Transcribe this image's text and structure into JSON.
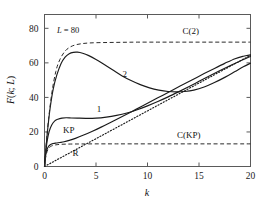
{
  "chart_data": {
    "type": "line",
    "title": "",
    "xlabel": "k",
    "ylabel": "F(k; L)",
    "xlim": [
      0,
      20
    ],
    "ylim": [
      0,
      88
    ],
    "xticks": [
      "0",
      "5",
      "10",
      "15",
      "20"
    ],
    "yticks": [
      "0",
      "20",
      "40",
      "60",
      "80"
    ],
    "xtick_values": [
      0,
      5,
      10,
      15,
      20
    ],
    "ytick_values": [
      0,
      20,
      40,
      60,
      80
    ],
    "grid": false,
    "legend": "inline-labels",
    "annotations": [
      {
        "text": "L = 80",
        "x": 1.6,
        "y": 81,
        "note": "panel parameter"
      }
    ],
    "series": [
      {
        "name": "2",
        "label": "2",
        "style": "solid",
        "label_x": 7.8,
        "label_y": 52,
        "x": [
          0,
          0.12,
          0.3,
          0.55,
          0.85,
          1.2,
          1.6,
          2.0,
          2.4,
          2.8,
          3.2,
          3.7,
          4.3,
          5.0,
          5.8,
          6.6,
          7.5,
          8.4,
          9.3,
          10.2,
          11.1,
          12.0,
          12.8,
          13.6,
          14.5,
          15.5,
          16.5,
          17.5,
          18.5,
          19.3,
          20
        ],
        "y": [
          0,
          9,
          21,
          34,
          45,
          53,
          59.5,
          63.3,
          65.3,
          66.1,
          66.2,
          65.6,
          64.2,
          62.0,
          59.0,
          56.0,
          52.6,
          49.8,
          47.4,
          45.5,
          44.2,
          43.4,
          43.2,
          43.4,
          44.2,
          46.0,
          48.6,
          51.6,
          55.0,
          57.7,
          59.8
        ]
      },
      {
        "name": "1",
        "label": "1",
        "style": "solid",
        "label_x": 5.3,
        "label_y": 31.5,
        "x": [
          0,
          0.1,
          0.25,
          0.45,
          0.7,
          1.0,
          1.3,
          1.7,
          2.1,
          2.6,
          3.2,
          4.0,
          5.0,
          6.0,
          7.0,
          8.0,
          9.0,
          10.0,
          11.0,
          12.0,
          13.0,
          14.0,
          15.0,
          16.0,
          17.0,
          18.0,
          19.0,
          20
        ],
        "y": [
          0,
          7,
          14.5,
          20.2,
          24.0,
          26.4,
          27.4,
          28.0,
          28.2,
          28.1,
          28.0,
          27.9,
          28.0,
          28.6,
          29.6,
          31.0,
          32.9,
          35.1,
          37.6,
          40.3,
          43.2,
          46.2,
          49.3,
          52.4,
          55.4,
          58.3,
          61.1,
          63.7
        ]
      },
      {
        "name": "KP",
        "label": "KP",
        "style": "solid",
        "label_x": 2.35,
        "label_y": 19.5,
        "x": [
          0,
          0.08,
          0.2,
          0.38,
          0.6,
          0.85,
          1.15,
          1.5,
          1.9,
          2.4,
          3.0,
          3.8,
          4.6,
          5.5,
          6.5,
          7.5,
          8.5,
          9.5,
          10.5,
          11.5,
          12.5,
          13.5,
          14.5,
          15.5,
          16.5,
          17.5,
          18.5,
          19.3,
          20
        ],
        "y": [
          0,
          5.0,
          9.0,
          11.6,
          12.8,
          13.3,
          13.6,
          13.9,
          14.3,
          15.1,
          16.3,
          18.2,
          20.3,
          22.8,
          25.8,
          28.8,
          31.9,
          35.0,
          38.2,
          41.3,
          44.5,
          47.6,
          50.7,
          53.8,
          56.8,
          59.7,
          62.4,
          63.8,
          64.6
        ]
      },
      {
        "name": "R",
        "label": "R",
        "style": "dotted",
        "label_x": 3.0,
        "label_y": 6.0,
        "x": [
          0,
          20
        ],
        "y": [
          0,
          64.4
        ]
      },
      {
        "name": "C(2)",
        "label": "C(2)",
        "style": "dashed",
        "label_x": 14.2,
        "label_y": 76.5,
        "x": [
          0,
          0.3,
          0.7,
          1.1,
          1.5,
          2.0,
          2.5,
          3.0,
          3.6,
          4.3,
          5.2,
          6.2,
          7.5,
          9.0,
          11.0,
          13.0,
          15.0,
          17.0,
          20
        ],
        "y": [
          0,
          22,
          42,
          55,
          62,
          66.8,
          69.2,
          70.4,
          71.1,
          71.5,
          71.7,
          71.8,
          71.9,
          72.0,
          72.0,
          72.0,
          72.0,
          72.0,
          72.0
        ]
      },
      {
        "name": "C(KP)",
        "label": "C(KP)",
        "style": "dashed",
        "label_x": 14.0,
        "label_y": 16.5,
        "x": [
          0,
          0.15,
          0.35,
          0.6,
          0.9,
          1.3,
          1.8,
          2.5,
          3.5,
          5.0,
          7.0,
          10.0,
          14.0,
          17.0,
          20
        ],
        "y": [
          0,
          6.5,
          10.0,
          11.6,
          12.3,
          12.7,
          12.9,
          13.0,
          13.05,
          13.1,
          13.1,
          13.1,
          13.1,
          13.1,
          13.1
        ]
      }
    ]
  },
  "axes": {
    "x_label": "k",
    "y_label": "F(k; L)"
  },
  "panel": {
    "parameter_symbol": "L",
    "parameter_text": "L = 80"
  }
}
